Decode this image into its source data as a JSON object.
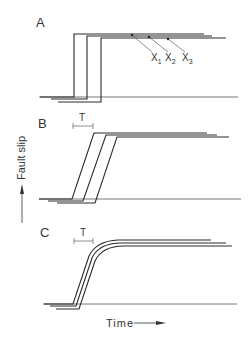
{
  "figure": {
    "y_axis_label": "Fault slip",
    "x_axis_label": "Time",
    "panels": [
      {
        "id": "A",
        "label": "A",
        "type": "step",
        "annotations": [
          "x1",
          "x2",
          "x3"
        ],
        "station_labels": {
          "x1": "X",
          "x1_sub": "1",
          "x2": "X",
          "x2_sub": "2",
          "x3": "X",
          "x3_sub": "3"
        }
      },
      {
        "id": "B",
        "label": "B",
        "type": "ramp",
        "rise_time_label": "T"
      },
      {
        "id": "C",
        "label": "C",
        "type": "smooth-ramp",
        "rise_time_label": "T"
      }
    ]
  },
  "colors": {
    "line": "#2a2a2a",
    "baseline": "#555555",
    "text": "#333333"
  }
}
